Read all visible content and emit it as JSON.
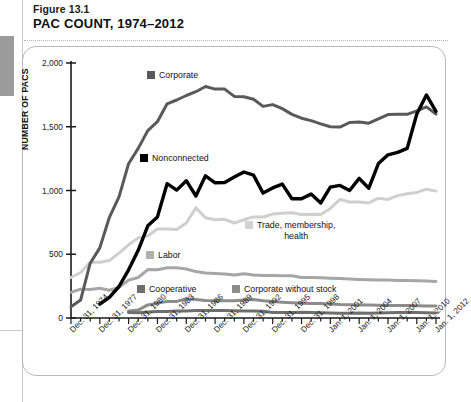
{
  "figure": {
    "number": "Figure 13.1",
    "title": "PAC COUNT, 1974–2012"
  },
  "chart_data": {
    "type": "line",
    "title": "PAC COUNT, 1974–2012",
    "xlabel": "",
    "ylabel": "NUMBER OF PACS",
    "ylim": [
      0,
      2000
    ],
    "yticks": [
      0,
      500,
      1000,
      1500,
      2000
    ],
    "ytick_labels": [
      "0",
      "500",
      "1,000",
      "1,500",
      "2,000"
    ],
    "grid": false,
    "legend_position": "inline-annotations",
    "x": [
      "Dec. 31, 1974",
      "Dec. 31, 1975",
      "Dec. 31, 1976",
      "Dec. 31, 1977",
      "Dec. 31, 1978",
      "Dec. 31, 1979",
      "Dec. 31, 1980",
      "Dec. 31, 1981",
      "Dec. 31, 1982",
      "Dec. 31, 1983",
      "Dec. 31, 1984",
      "Dec. 31, 1985",
      "Dec. 31, 1986",
      "Dec. 31, 1987",
      "Dec. 31, 1988",
      "Dec. 31, 1989",
      "Dec. 31, 1990",
      "Dec. 31, 1991",
      "Dec. 31, 1992",
      "Dec. 31, 1993",
      "Dec. 31, 1994",
      "Dec. 31, 1995",
      "Dec. 31, 1996",
      "Dec. 31, 1997",
      "Dec. 31, 1998",
      "Dec. 31, 1999",
      "Dec. 31, 2000",
      "Jan. 1, 2001",
      "Jan. 1, 2002",
      "Jan. 1, 2003",
      "Jan. 1, 2004",
      "Jan. 1, 2005",
      "Jan. 1, 2006",
      "Jan. 1, 2007",
      "Jan. 1, 2008",
      "Jan. 1, 2009",
      "Jan. 1, 2010",
      "Jan. 1, 2011",
      "Jan. 1, 2012"
    ],
    "xtick_labels_shown": [
      "Dec. 31, 1974",
      "Dec. 31, 1977",
      "Dec. 31, 1980",
      "Dec. 31, 1983",
      "Dec. 31, 1986",
      "Dec. 31, 1989",
      "Dec. 31, 1992",
      "Dec. 31, 1995",
      "Dec. 31, 1998",
      "Jan. 1, 2001",
      "Jan. 1, 2004",
      "Jan. 1, 2007",
      "Jan. 1, 2010",
      "Jan. 1, 2012"
    ],
    "series": [
      {
        "name": "Corporate",
        "color": "#595959",
        "values": [
          89,
          140,
          430,
          550,
          790,
          950,
          1210,
          1330,
          1470,
          1540,
          1680,
          1710,
          1745,
          1775,
          1816,
          1795,
          1795,
          1738,
          1735,
          1715,
          1660,
          1674,
          1642,
          1597,
          1567,
          1548,
          1523,
          1500,
          1497,
          1533,
          1538,
          1528,
          1562,
          1595,
          1598,
          1598,
          1624,
          1656,
          1600
        ]
      },
      {
        "name": "Nonconnected",
        "color": "#000000",
        "values": [
          0,
          0,
          0,
          110,
          162,
          247,
          378,
          531,
          723,
          793,
          1053,
          1003,
          1077,
          957,
          1115,
          1060,
          1062,
          1105,
          1145,
          1121,
          980,
          1020,
          1050,
          935,
          935,
          972,
          902,
          1026,
          1040,
          1000,
          1095,
          1018,
          1211,
          1280,
          1300,
          1330,
          1600,
          1750,
          1620
        ]
      },
      {
        "name": "Trade, membership, health",
        "color": "#cfcfcf",
        "values": [
          318,
          357,
          438,
          438,
          451,
          509,
          574,
          628,
          644,
          698,
          698,
          695,
          745,
          865,
          786,
          770,
          774,
          745,
          770,
          793,
          792,
          815,
          821,
          825,
          812,
          814,
          812,
          860,
          930,
          910,
          910,
          902,
          940,
          930,
          960,
          975,
          985,
          1010,
          995
        ]
      },
      {
        "name": "Labor",
        "color": "#a6a6a6",
        "values": [
          201,
          226,
          224,
          234,
          217,
          240,
          297,
          318,
          380,
          378,
          394,
          394,
          384,
          364,
          354,
          349,
          346,
          338,
          347,
          337,
          333,
          334,
          332,
          332,
          318,
          318,
          316,
          312,
          310,
          305,
          302,
          300,
          298,
          297,
          295,
          294,
          292,
          290,
          287
        ]
      },
      {
        "name": "Corporate without stock",
        "color": "#8c8c8c",
        "values": [
          0,
          0,
          0,
          0,
          0,
          0,
          56,
          62,
          103,
          116,
          130,
          130,
          151,
          145,
          138,
          136,
          136,
          136,
          142,
          146,
          136,
          129,
          124,
          119,
          115,
          114,
          114,
          110,
          106,
          104,
          103,
          101,
          100,
          99,
          98,
          97,
          96,
          95,
          94
        ]
      },
      {
        "name": "Cooperative",
        "color": "#6e6e6e",
        "values": [
          0,
          0,
          0,
          0,
          0,
          0,
          42,
          41,
          47,
          52,
          52,
          54,
          56,
          59,
          59,
          59,
          59,
          57,
          56,
          56,
          53,
          44,
          42,
          42,
          45,
          43,
          41,
          39,
          38,
          38,
          39,
          38,
          39,
          41,
          42,
          42,
          42,
          41,
          40
        ]
      }
    ]
  },
  "annotations": [
    {
      "label": "Corporate",
      "swatch": "#595959",
      "x": 147,
      "y": 70
    },
    {
      "label": "Nonconnected",
      "swatch": "#000000",
      "x": 140,
      "y": 153
    },
    {
      "label": "Trade, membership,",
      "label2": "health",
      "swatch": "#d2d2d2",
      "x": 245,
      "y": 220
    },
    {
      "label": "Labor",
      "swatch": "#b0b0b0",
      "x": 146,
      "y": 250
    },
    {
      "label": "Cooperative",
      "swatch": "#6e6e6e",
      "x": 137,
      "y": 284
    },
    {
      "label": "Corporate without stock",
      "swatch": "#8c8c8c",
      "x": 232,
      "y": 284
    }
  ]
}
